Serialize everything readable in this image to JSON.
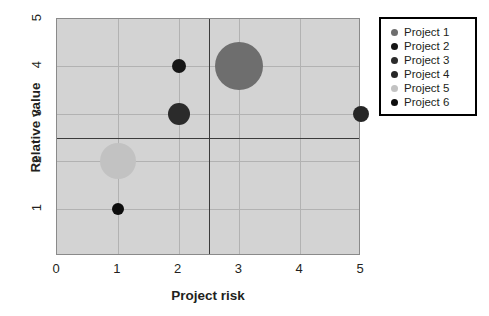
{
  "chart_data": {
    "type": "scatter",
    "title": "",
    "xlabel": "Project risk",
    "ylabel": "Relative value",
    "xlim": [
      0,
      5
    ],
    "ylim": [
      0,
      5
    ],
    "xticks": [
      "0",
      "1",
      "2",
      "3",
      "4",
      "5"
    ],
    "yticks": [
      "1",
      "2",
      "3",
      "4",
      "5"
    ],
    "grid": true,
    "legend_position": "right",
    "quadrant_divider_x": 2.5,
    "quadrant_divider_y": 2.5,
    "series": [
      {
        "name": "Project 1",
        "x": 3,
        "y": 4,
        "size": 24,
        "color": "#6e6e6e"
      },
      {
        "name": "Project 2",
        "x": 2,
        "y": 4,
        "size": 7,
        "color": "#161616"
      },
      {
        "name": "Project 3",
        "x": 2,
        "y": 3,
        "size": 11,
        "color": "#2b2b2b"
      },
      {
        "name": "Project 4",
        "x": 5,
        "y": 3,
        "size": 8,
        "color": "#262626"
      },
      {
        "name": "Project 5",
        "x": 1,
        "y": 2,
        "size": 18,
        "color": "#c2c2c2"
      },
      {
        "name": "Project 6",
        "x": 1,
        "y": 1,
        "size": 6,
        "color": "#0d0d0d"
      }
    ]
  },
  "axes": {
    "x": {
      "label": "Project risk",
      "ticks": [
        {
          "value": "0"
        },
        {
          "value": "1"
        },
        {
          "value": "2"
        },
        {
          "value": "3"
        },
        {
          "value": "4"
        },
        {
          "value": "5"
        }
      ]
    },
    "y": {
      "label": "Relative value",
      "ticks": [
        {
          "value": "1"
        },
        {
          "value": "2"
        },
        {
          "value": "3"
        },
        {
          "value": "4"
        },
        {
          "value": "5"
        }
      ]
    }
  },
  "legend": {
    "items": [
      {
        "label": "Project 1",
        "color": "#6e6e6e"
      },
      {
        "label": "Project 2",
        "color": "#161616"
      },
      {
        "label": "Project 3",
        "color": "#2b2b2b"
      },
      {
        "label": "Project 4",
        "color": "#262626"
      },
      {
        "label": "Project 5",
        "color": "#c2c2c2"
      },
      {
        "label": "Project 6",
        "color": "#0d0d0d"
      }
    ]
  },
  "colors": {
    "plot_background": "#d3d3d3",
    "gridline": "#b2b2b2",
    "divider": "#3b3b3b",
    "text": "#231f20",
    "legend_border": "#000000"
  }
}
